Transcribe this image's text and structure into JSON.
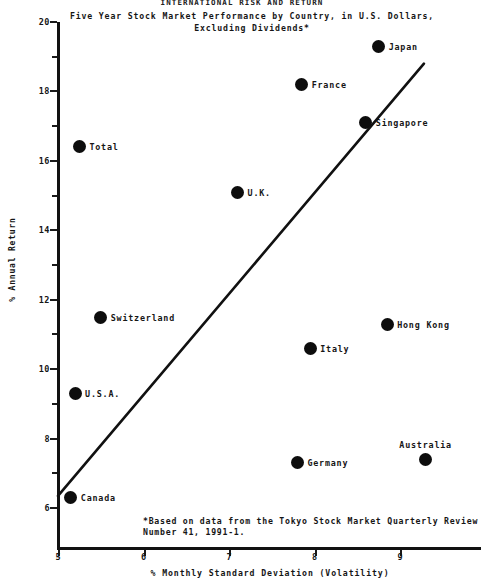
{
  "chart_data": {
    "type": "scatter",
    "title": "INTERNATIONAL RISK AND RETURN",
    "subtitle": "Five Year Stock Market Performance by Country, in U.S. Dollars,\nExcluding Dividends*",
    "xlabel": "% Monthly  Standard Deviation (Volatility)",
    "ylabel": "% Annual Return",
    "xlim": [
      5,
      9.9
    ],
    "ylim": [
      5.6,
      20
    ],
    "xticks": [
      5,
      6,
      7,
      8,
      9
    ],
    "yticks": [
      6,
      8,
      10,
      12,
      14,
      16,
      18,
      20
    ],
    "y_minor_ticks": [
      7,
      9,
      11,
      13,
      15,
      17,
      19
    ],
    "grid": false,
    "legend": "none",
    "marker_color": "#0d0d0d",
    "annotation": "*Based on data from the Tokyo Stock Market Quarterly Review\n Number 41, 1991-1.",
    "trendline": {
      "x0": 5.0,
      "y0": 6.35,
      "x1": 9.28,
      "y1": 18.8
    },
    "points": [
      {
        "label": "Japan",
        "x": 8.75,
        "y": 19.3,
        "label_pos": "right"
      },
      {
        "label": "France",
        "x": 7.85,
        "y": 18.2,
        "label_pos": "right"
      },
      {
        "label": "Singapore",
        "x": 8.6,
        "y": 17.1,
        "label_pos": "right"
      },
      {
        "label": "Total",
        "x": 5.25,
        "y": 16.4,
        "label_pos": "right"
      },
      {
        "label": "U.K.",
        "x": 7.1,
        "y": 15.1,
        "label_pos": "right"
      },
      {
        "label": "Switzerland",
        "x": 5.5,
        "y": 11.5,
        "label_pos": "right"
      },
      {
        "label": "Hong Kong",
        "x": 8.85,
        "y": 11.3,
        "label_pos": "right"
      },
      {
        "label": "Italy",
        "x": 7.95,
        "y": 10.6,
        "label_pos": "right"
      },
      {
        "label": "U.S.A.",
        "x": 5.2,
        "y": 9.3,
        "label_pos": "right"
      },
      {
        "label": "Australia",
        "x": 9.3,
        "y": 7.4,
        "label_pos": "above"
      },
      {
        "label": "Germany",
        "x": 7.8,
        "y": 7.3,
        "label_pos": "right"
      },
      {
        "label": "Canada",
        "x": 5.15,
        "y": 6.3,
        "label_pos": "right"
      }
    ]
  }
}
